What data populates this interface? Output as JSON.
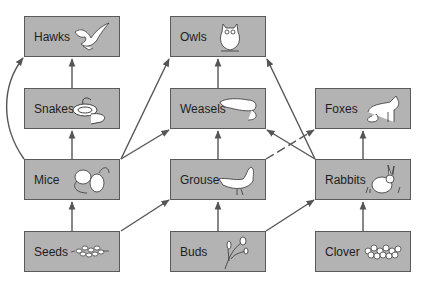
{
  "diagram": {
    "colors": {
      "box_fill": "#b3b3b3",
      "box_border": "#5a5a5a",
      "arrow": "#555555",
      "text": "#1e1e1e"
    },
    "nodes": [
      {
        "id": "hawks",
        "label": "Hawks",
        "icon": "hawk-icon",
        "col": 0,
        "row": 0
      },
      {
        "id": "owls",
        "label": "Owls",
        "icon": "owl-icon",
        "col": 1,
        "row": 0
      },
      {
        "id": "snakes",
        "label": "Snakes",
        "icon": "snake-icon",
        "col": 0,
        "row": 1
      },
      {
        "id": "weasels",
        "label": "Weasels",
        "icon": "weasel-icon",
        "col": 1,
        "row": 1
      },
      {
        "id": "foxes",
        "label": "Foxes",
        "icon": "fox-icon",
        "col": 2,
        "row": 1
      },
      {
        "id": "mice",
        "label": "Mice",
        "icon": "mice-icon",
        "col": 0,
        "row": 2
      },
      {
        "id": "grouse",
        "label": "Grouse",
        "icon": "grouse-icon",
        "col": 1,
        "row": 2
      },
      {
        "id": "rabbits",
        "label": "Rabbits",
        "icon": "rabbit-icon",
        "col": 2,
        "row": 2
      },
      {
        "id": "seeds",
        "label": "Seeds",
        "icon": "seeds-icon",
        "col": 0,
        "row": 3
      },
      {
        "id": "buds",
        "label": "Buds",
        "icon": "buds-icon",
        "col": 1,
        "row": 3
      },
      {
        "id": "clover",
        "label": "Clover",
        "icon": "clover-icon",
        "col": 2,
        "row": 3
      }
    ],
    "edges": [
      {
        "from": "seeds",
        "to": "mice",
        "style": "solid"
      },
      {
        "from": "seeds",
        "to": "grouse",
        "style": "solid"
      },
      {
        "from": "buds",
        "to": "grouse",
        "style": "solid"
      },
      {
        "from": "buds",
        "to": "rabbits",
        "style": "solid"
      },
      {
        "from": "clover",
        "to": "rabbits",
        "style": "solid"
      },
      {
        "from": "mice",
        "to": "snakes",
        "style": "solid"
      },
      {
        "from": "mice",
        "to": "hawks",
        "style": "curved"
      },
      {
        "from": "mice",
        "to": "owls",
        "style": "solid"
      },
      {
        "from": "mice",
        "to": "weasels",
        "style": "solid"
      },
      {
        "from": "grouse",
        "to": "weasels",
        "style": "solid"
      },
      {
        "from": "grouse",
        "to": "foxes",
        "style": "dashed"
      },
      {
        "from": "rabbits",
        "to": "foxes",
        "style": "solid"
      },
      {
        "from": "rabbits",
        "to": "weasels",
        "style": "solid"
      },
      {
        "from": "rabbits",
        "to": "owls",
        "style": "solid"
      },
      {
        "from": "snakes",
        "to": "hawks",
        "style": "solid"
      },
      {
        "from": "weasels",
        "to": "owls",
        "style": "solid"
      }
    ]
  }
}
